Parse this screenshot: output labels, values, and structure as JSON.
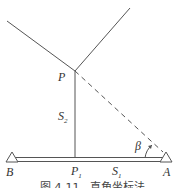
{
  "figure": {
    "caption": "图 4-11   直角坐标法",
    "points": {
      "P": {
        "label": "P",
        "x": 75,
        "y": 71
      },
      "P1": {
        "label": "P",
        "sub": "1",
        "x": 75,
        "y": 159
      },
      "A": {
        "label": "A",
        "x": 165,
        "y": 159
      },
      "B": {
        "label": "B",
        "x": 12,
        "y": 159
      }
    },
    "segments": {
      "S1": {
        "label": "S",
        "sub": "1"
      },
      "S2": {
        "label": "S",
        "sub": "2"
      }
    },
    "angle": {
      "label": "β"
    },
    "colors": {
      "line": "#555555",
      "text": "#333333"
    }
  }
}
